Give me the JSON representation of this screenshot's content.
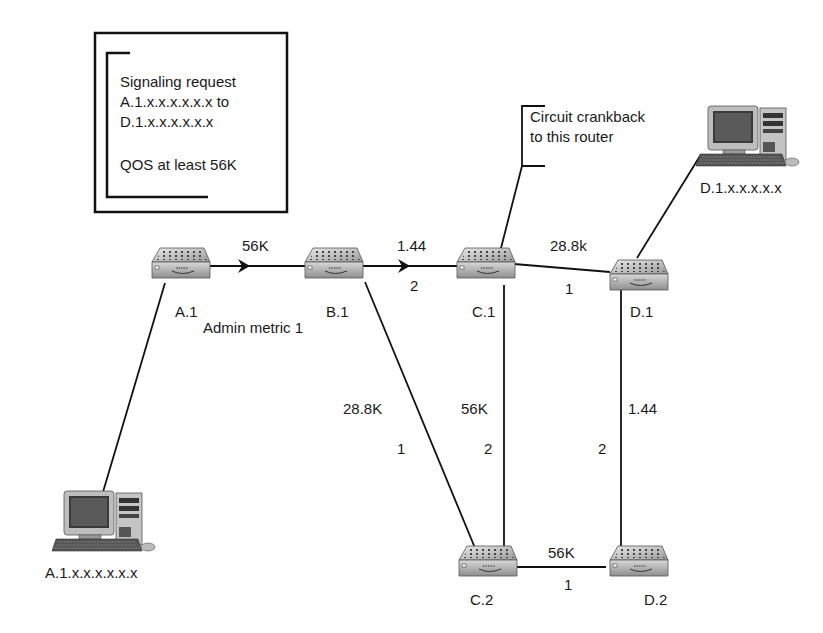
{
  "diagram": {
    "type": "network-topology",
    "request_note": {
      "lines": [
        "Signaling request",
        "A.1.x.x.x.x.x.x to",
        "D.1.x.x.x.x.x.x",
        "",
        "QOS at least 56K"
      ]
    },
    "crankback_note": {
      "lines": [
        "Circuit crankback",
        "to this router"
      ]
    },
    "admin_metric_label": "Admin metric 1",
    "routers": [
      {
        "id": "A.1",
        "label": "A.1"
      },
      {
        "id": "B.1",
        "label": "B.1"
      },
      {
        "id": "C.1",
        "label": "C.1"
      },
      {
        "id": "D.1",
        "label": "D.1"
      },
      {
        "id": "C.2",
        "label": "C.2"
      },
      {
        "id": "D.2",
        "label": "D.2"
      }
    ],
    "hosts": [
      {
        "id": "host-a",
        "label": "A.1.x.x.x.x.x.x",
        "attached_to": "A.1"
      },
      {
        "id": "host-d",
        "label": "D.1.x.x.x.x.x",
        "attached_to": "D.1"
      }
    ],
    "links": [
      {
        "from": "A.1",
        "to": "B.1",
        "bandwidth": "56K",
        "metric": "",
        "arrow": true
      },
      {
        "from": "B.1",
        "to": "C.1",
        "bandwidth": "1.44",
        "metric": "2",
        "arrow": true
      },
      {
        "from": "C.1",
        "to": "D.1",
        "bandwidth": "28.8k",
        "metric": "1",
        "arrow": false
      },
      {
        "from": "B.1",
        "to": "C.2",
        "bandwidth": "28.8K",
        "metric": "1",
        "arrow": false
      },
      {
        "from": "C.1",
        "to": "C.2",
        "bandwidth": "56K",
        "metric": "2",
        "arrow": false
      },
      {
        "from": "D.1",
        "to": "D.2",
        "bandwidth": "1.44",
        "metric": "2",
        "arrow": false
      },
      {
        "from": "C.2",
        "to": "D.2",
        "bandwidth": "56K",
        "metric": "1",
        "arrow": false
      }
    ]
  }
}
